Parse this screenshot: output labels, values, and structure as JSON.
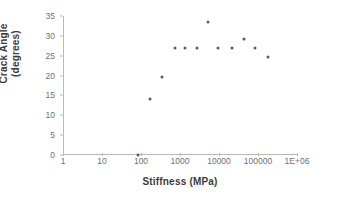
{
  "chart_data": {
    "type": "scatter",
    "title": "",
    "xlabel": "Stiffness (MPa)",
    "ylabel_line1": "Crack Angle",
    "ylabel_line2": "(degrees)",
    "ylabel": "Crack Angle (degrees)",
    "xscale": "log",
    "yscale": "linear",
    "xlim": [
      1,
      1000000
    ],
    "ylim": [
      0,
      35
    ],
    "grid": false,
    "legend": null,
    "point_color": "#5a5a63",
    "axis_color": "#b9b9b9",
    "tick_label_color": "#6f6f6f",
    "axis_title_color": "#3c3c3c",
    "xticks": [
      1,
      10,
      100,
      1000,
      10000,
      100000,
      1000000
    ],
    "xtick_labels": [
      "1",
      "10",
      "100",
      "1000",
      "10000",
      "100000",
      "1E+06"
    ],
    "yticks": [
      0,
      5,
      10,
      15,
      20,
      25,
      30,
      35
    ],
    "ytick_labels": [
      "0",
      "5",
      "10",
      "15",
      "20",
      "25",
      "30",
      "35"
    ],
    "series": [
      {
        "name": "Crack angle vs stiffness",
        "points": [
          {
            "x": 80,
            "y": 0.0
          },
          {
            "x": 160,
            "y": 14.2
          },
          {
            "x": 330,
            "y": 19.6
          },
          {
            "x": 700,
            "y": 27.0
          },
          {
            "x": 1300,
            "y": 27.0
          },
          {
            "x": 2500,
            "y": 27.0
          },
          {
            "x": 5000,
            "y": 33.4
          },
          {
            "x": 9000,
            "y": 27.0
          },
          {
            "x": 20000,
            "y": 27.0
          },
          {
            "x": 42000,
            "y": 29.2
          },
          {
            "x": 80000,
            "y": 27.0
          },
          {
            "x": 170000,
            "y": 24.8
          }
        ]
      }
    ]
  }
}
